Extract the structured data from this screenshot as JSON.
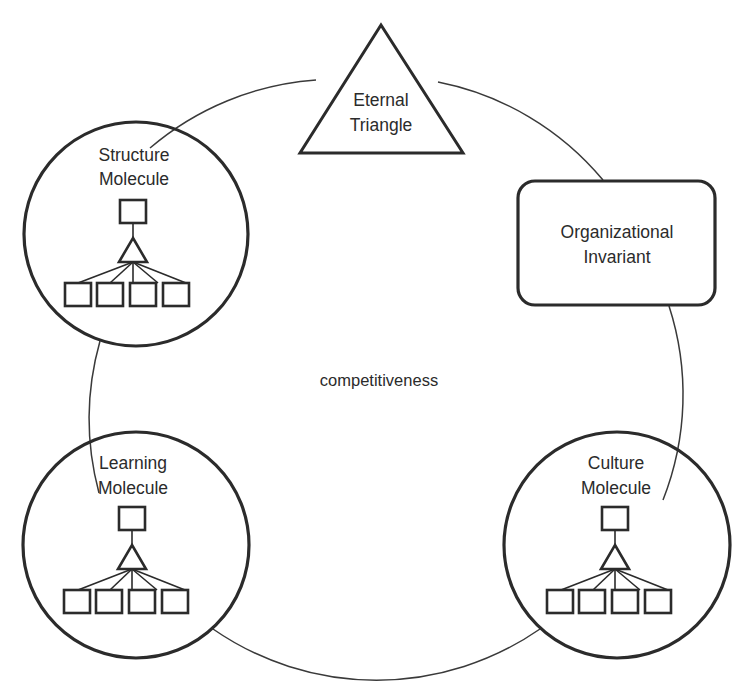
{
  "diagram": {
    "center_label": "competitiveness",
    "colors": {
      "stroke": "#2b2b2b",
      "arc": "#3a3a3a",
      "background": "#ffffff",
      "text": "#2b2b2b"
    },
    "nodes": [
      {
        "id": "eternal-triangle",
        "shape": "triangle",
        "label_line1": "Eternal",
        "label_line2": "Triangle",
        "position": "top"
      },
      {
        "id": "structure-molecule",
        "shape": "circle",
        "label_line1": "Structure",
        "label_line2": "Molecule",
        "position": "upper-left",
        "contains": "molecule-glyph"
      },
      {
        "id": "organizational-invariant",
        "shape": "rounded-rectangle",
        "label_line1": "Organizational",
        "label_line2": "Invariant",
        "position": "upper-right"
      },
      {
        "id": "learning-molecule",
        "shape": "circle",
        "label_line1": "Learning",
        "label_line2": "Molecule",
        "position": "lower-left",
        "contains": "molecule-glyph"
      },
      {
        "id": "culture-molecule",
        "shape": "circle",
        "label_line1": "Culture",
        "label_line2": "Molecule",
        "position": "lower-right",
        "contains": "molecule-glyph"
      }
    ],
    "molecule_glyph": {
      "top_squares": 1,
      "triangles": 1,
      "bottom_squares": 4,
      "fan_links": 5
    },
    "connector": {
      "type": "circular-arc-ring",
      "segments": 5,
      "description": "A large circle arc links the five nodes in a ring"
    }
  }
}
